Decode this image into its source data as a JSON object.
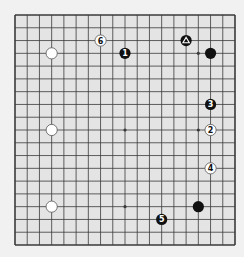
{
  "diagram": {
    "type": "go-board",
    "size": 19,
    "colors": {
      "background": "#f1f1f1",
      "board": "#e4e4e4",
      "line": "#3a3a3a",
      "black_stone": "#111111",
      "white_stone": "#ffffff",
      "white_stone_stroke": "#555555"
    },
    "star_points": [
      [
        3,
        3
      ],
      [
        9,
        3
      ],
      [
        15,
        3
      ],
      [
        3,
        9
      ],
      [
        9,
        9
      ],
      [
        15,
        9
      ],
      [
        3,
        15
      ],
      [
        9,
        15
      ],
      [
        15,
        15
      ]
    ],
    "stones": [
      {
        "col": 3,
        "row": 3,
        "color": "white",
        "label": ""
      },
      {
        "col": 3,
        "row": 9,
        "color": "white",
        "label": ""
      },
      {
        "col": 3,
        "row": 15,
        "color": "white",
        "label": ""
      },
      {
        "col": 16,
        "row": 3,
        "color": "black",
        "label": ""
      },
      {
        "col": 15,
        "row": 15,
        "color": "black",
        "label": ""
      },
      {
        "col": 14,
        "row": 2,
        "color": "black",
        "label": "",
        "mark": "triangle"
      },
      {
        "col": 9,
        "row": 3,
        "color": "black",
        "label": "1"
      },
      {
        "col": 16,
        "row": 9,
        "color": "white",
        "label": "2"
      },
      {
        "col": 16,
        "row": 7,
        "color": "black",
        "label": "3"
      },
      {
        "col": 16,
        "row": 12,
        "color": "white",
        "label": "4"
      },
      {
        "col": 12,
        "row": 16,
        "color": "black",
        "label": "5"
      },
      {
        "col": 7,
        "row": 2,
        "color": "white",
        "label": "6"
      }
    ]
  }
}
